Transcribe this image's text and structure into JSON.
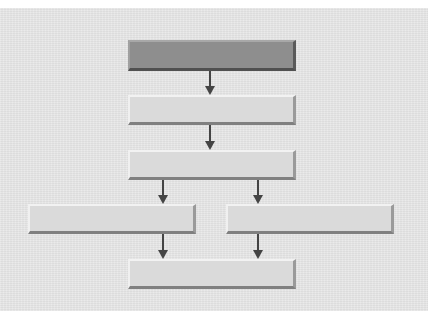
{
  "diagram": {
    "type": "flowchart",
    "colors": {
      "background": "#e4e4e4",
      "box_fill": "#dadada",
      "box_highlight_fill": "#8e8e8e",
      "arrow": "#444444"
    },
    "nodes": [
      {
        "id": "node-1",
        "label": "",
        "style": "dark",
        "x": 128,
        "y": 40,
        "w": 168,
        "h": 31
      },
      {
        "id": "node-2",
        "label": "",
        "style": "light",
        "x": 128,
        "y": 95,
        "w": 168,
        "h": 30
      },
      {
        "id": "node-3",
        "label": "",
        "style": "light",
        "x": 128,
        "y": 150,
        "w": 168,
        "h": 30
      },
      {
        "id": "node-4a",
        "label": "",
        "style": "light",
        "x": 28,
        "y": 204,
        "w": 168,
        "h": 30
      },
      {
        "id": "node-4b",
        "label": "",
        "style": "light",
        "x": 226,
        "y": 204,
        "w": 168,
        "h": 30
      },
      {
        "id": "node-5",
        "label": "",
        "style": "light",
        "x": 128,
        "y": 259,
        "w": 168,
        "h": 30
      }
    ],
    "edges": [
      {
        "from": "node-1",
        "to": "node-2"
      },
      {
        "from": "node-2",
        "to": "node-3"
      },
      {
        "from": "node-3",
        "to": "node-4a"
      },
      {
        "from": "node-3",
        "to": "node-4b"
      },
      {
        "from": "node-4a",
        "to": "node-5"
      },
      {
        "from": "node-4b",
        "to": "node-5"
      }
    ]
  }
}
